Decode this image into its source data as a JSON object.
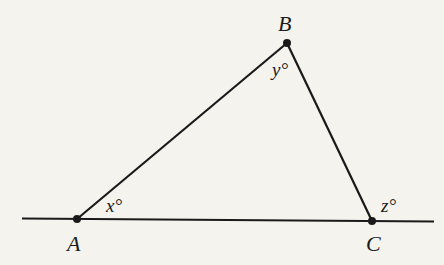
{
  "diagram": {
    "type": "triangle with extended base line",
    "points": {
      "A": {
        "label": "A",
        "x": 77,
        "y": 219
      },
      "B": {
        "label": "B",
        "x": 287,
        "y": 43
      },
      "C": {
        "label": "C",
        "x": 372,
        "y": 221
      }
    },
    "angles": {
      "x": {
        "label": "x°",
        "at": "A"
      },
      "y": {
        "label": "y°",
        "at": "B"
      },
      "z": {
        "label": "z°",
        "at": "C",
        "note": "exterior angle"
      }
    },
    "colors": {
      "background": "#f4f3ee",
      "ink": "#1a1a1a"
    }
  }
}
